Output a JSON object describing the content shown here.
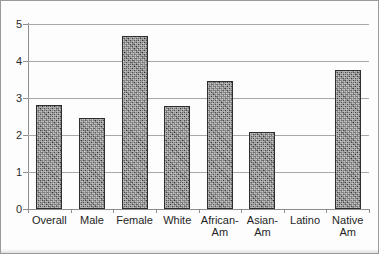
{
  "chart_data": {
    "type": "bar",
    "title": "",
    "subtitle": "",
    "xlabel": "",
    "ylabel": "",
    "ylim": [
      0,
      5
    ],
    "ytick_labels": [
      "0",
      "1",
      "2",
      "3",
      "4",
      "5"
    ],
    "ytick_values": [
      0,
      1,
      2,
      3,
      4,
      5
    ],
    "grid": "horizontal",
    "legend": "none",
    "categories": [
      "Overall",
      "Male",
      "Female",
      "White",
      "African-\nAm",
      "Asian-\nAm",
      "Latino",
      "Native\nAm"
    ],
    "values": [
      2.8,
      2.47,
      4.68,
      2.78,
      3.47,
      2.07,
      0,
      3.75
    ],
    "series": [
      {
        "name": "Series 1",
        "values": [
          2.8,
          2.47,
          4.68,
          2.78,
          3.47,
          2.07,
          0,
          3.75
        ]
      }
    ]
  },
  "style": {
    "bar_fill": "#5a5a5a",
    "bar_border": "#2e2e2e",
    "gridline_color": "#a8a8a8",
    "axis_color": "#8e8e8e",
    "frame_color": "#9a9a9a",
    "text_color": "#1f1f1f",
    "background": "#fdfdfd"
  }
}
